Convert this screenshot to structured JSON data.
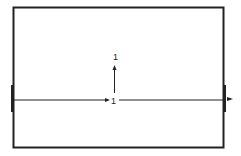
{
  "diagram": {
    "labels": {
      "vertical_top": "1",
      "horizontal_mid": "1"
    },
    "colors": {
      "stroke": "#222222",
      "background": "#ffffff"
    }
  }
}
